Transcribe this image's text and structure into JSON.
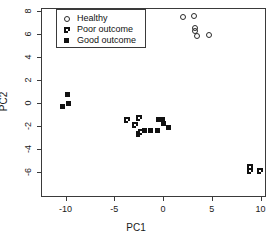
{
  "chart_data": {
    "type": "scatter",
    "title": "",
    "xlabel": "PC1",
    "ylabel": "PC2",
    "xlim": [
      -12.4,
      10.6
    ],
    "ylim": [
      -7.2,
      8.7
    ],
    "xticks": [
      -10,
      -5,
      0,
      5,
      10
    ],
    "xticklabels": [
      "-10",
      "-5",
      "0",
      "5",
      "10"
    ],
    "yticks": [
      8,
      6,
      4,
      2,
      0,
      -2,
      -4,
      -6
    ],
    "yticklabels": [
      "8",
      "6",
      "4",
      "2",
      "0",
      "-2",
      "-4",
      "-6"
    ],
    "grid": false,
    "legend_position": "top-left",
    "series": [
      {
        "name": "Healthy",
        "marker": "open-circle",
        "color": "#2a2a2a",
        "points": [
          {
            "x": 2.1,
            "y": 7.5
          },
          {
            "x": 3.2,
            "y": 7.6
          },
          {
            "x": 3.3,
            "y": 6.5
          },
          {
            "x": 3.3,
            "y": 6.3
          },
          {
            "x": 3.5,
            "y": 5.8
          },
          {
            "x": 4.7,
            "y": 5.9
          }
        ]
      },
      {
        "name": "Poor outcome",
        "marker": "crossed-square",
        "color": "#111111",
        "points": [
          {
            "x": -3.7,
            "y": -1.5
          },
          {
            "x": -2.5,
            "y": -1.3
          },
          {
            "x": -2.9,
            "y": -1.9
          },
          {
            "x": -2.5,
            "y": -2.7
          },
          {
            "x": -2.3,
            "y": -2.5
          },
          {
            "x": 8.9,
            "y": -5.6
          },
          {
            "x": 8.9,
            "y": -5.9
          },
          {
            "x": 9.9,
            "y": -5.9
          }
        ]
      },
      {
        "name": "Good outcome",
        "marker": "filled-square",
        "color": "#111111",
        "points": [
          {
            "x": -10.3,
            "y": -0.3
          },
          {
            "x": -9.8,
            "y": 0.7
          },
          {
            "x": -9.7,
            "y": 0.0
          },
          {
            "x": -1.9,
            "y": -2.4
          },
          {
            "x": -1.3,
            "y": -2.4
          },
          {
            "x": -0.6,
            "y": -2.4
          },
          {
            "x": -0.5,
            "y": -1.4
          },
          {
            "x": -0.1,
            "y": -1.4
          },
          {
            "x": 0.0,
            "y": -1.8
          },
          {
            "x": 0.6,
            "y": -2.1
          }
        ]
      }
    ]
  },
  "legend": {
    "items": [
      {
        "label": "Healthy",
        "marker": "open-circle"
      },
      {
        "label": "Poor outcome",
        "marker": "crossed-square"
      },
      {
        "label": "Good outcome",
        "marker": "filled-square"
      }
    ]
  }
}
